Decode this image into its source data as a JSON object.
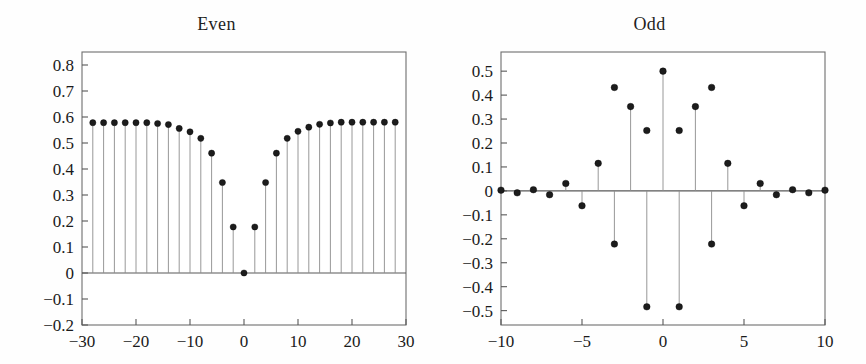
{
  "figure": {
    "background_color": "#fefefe",
    "marker_color": "#1c1c1c",
    "stem_color": "#8c8c8c",
    "frame_color": "#6e6e6e"
  },
  "chart_data": [
    {
      "type": "line",
      "plot_style": "stem",
      "title": "Even",
      "xlabel": "",
      "ylabel": "",
      "xlim": [
        -30,
        30
      ],
      "ylim": [
        -0.2,
        0.85
      ],
      "grid": false,
      "legend": "none",
      "xticks": [
        -30,
        -20,
        -10,
        0,
        10,
        20,
        30
      ],
      "xtick_labels": [
        "−30",
        "−20",
        "−10",
        "0",
        "10",
        "20",
        "30"
      ],
      "yticks": [
        -0.2,
        -0.1,
        0,
        0.1,
        0.2,
        0.3,
        0.4,
        0.5,
        0.6,
        0.7,
        0.8
      ],
      "ytick_labels": [
        "−0.2",
        "−0.1",
        "0",
        "0.1",
        "0.2",
        "0.3",
        "0.4",
        "0.5",
        "0.6",
        "0.7",
        "0.8"
      ],
      "x": [
        -28,
        -26,
        -24,
        -22,
        -20,
        -18,
        -16,
        -14,
        -12,
        -10,
        -8,
        -6,
        -4,
        -2,
        0,
        2,
        4,
        6,
        8,
        10,
        12,
        14,
        16,
        18,
        20,
        22,
        24,
        26,
        28
      ],
      "values": [
        0.578,
        0.578,
        0.578,
        0.578,
        0.578,
        0.578,
        0.575,
        0.571,
        0.556,
        0.543,
        0.518,
        0.461,
        0.348,
        0.177,
        0.0,
        0.177,
        0.348,
        0.461,
        0.518,
        0.545,
        0.561,
        0.572,
        0.577,
        0.58,
        0.58,
        0.58,
        0.58,
        0.58,
        0.58
      ]
    },
    {
      "type": "line",
      "plot_style": "stem",
      "title": "Odd",
      "xlabel": "",
      "ylabel": "",
      "xlim": [
        -10,
        10
      ],
      "ylim": [
        -0.56,
        0.58
      ],
      "grid": false,
      "legend": "none",
      "xticks": [
        -10,
        -5,
        0,
        5,
        10
      ],
      "xtick_labels": [
        "−10",
        "−5",
        "0",
        "5",
        "10"
      ],
      "yticks": [
        -0.5,
        -0.4,
        -0.3,
        -0.2,
        -0.1,
        0,
        0.1,
        0.2,
        0.3,
        0.4,
        0.5
      ],
      "ytick_labels": [
        "−0.5",
        "−0.4",
        "−0.3",
        "−0.2",
        "−0.1",
        "0",
        "0.1",
        "0.2",
        "0.3",
        "0.4",
        "0.5"
      ],
      "x": [
        -10,
        -9,
        -8,
        -7,
        -6,
        -5,
        -4,
        -3,
        -2,
        -1,
        0,
        1,
        2,
        3,
        4,
        5,
        6,
        7,
        8,
        9,
        10
      ],
      "values": [
        0.003,
        -0.008,
        0.005,
        -0.016,
        0.031,
        -0.062,
        0.115,
        -0.222,
        0.352,
        -0.484,
        0.5,
        -0.484,
        0.352,
        -0.222,
        0.115,
        -0.062,
        0.031,
        -0.016,
        0.005,
        -0.008,
        0.003
      ]
    }
  ],
  "extra_markers": {
    "odd_secondary": {
      "note": "upper points on negative stems",
      "x": [
        -3,
        -1,
        1,
        3
      ],
      "values": [
        0.432,
        0.252,
        0.252,
        0.432
      ]
    }
  }
}
